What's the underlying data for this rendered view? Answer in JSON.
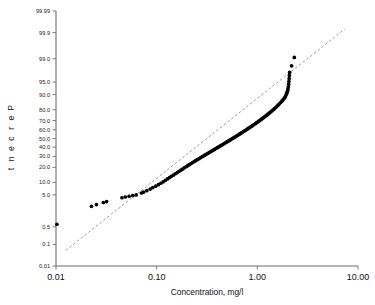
{
  "chart_data": {
    "type": "scatter",
    "title": "",
    "subtitle": "",
    "xlabel": "Concentration, mg/l",
    "ylabel": "Percent",
    "xscale": "log",
    "yscale": "probability",
    "xlim": [
      0.01,
      10.0
    ],
    "ylim": [
      0.01,
      99.99
    ],
    "grid": false,
    "legend": null,
    "x_ticks": [
      {
        "value": 0.01,
        "label": "0.01"
      },
      {
        "value": 0.1,
        "label": "0.10"
      },
      {
        "value": 1.0,
        "label": "1.00"
      },
      {
        "value": 10.0,
        "label": "10.00"
      }
    ],
    "y_ticks": [
      {
        "value": 99.99,
        "label": "99.99"
      },
      {
        "value": 99.9,
        "label": "99.9"
      },
      {
        "value": 99.0,
        "label": "99.0"
      },
      {
        "value": 95.0,
        "label": "95.0"
      },
      {
        "value": 90.0,
        "label": "90.0"
      },
      {
        "value": 80.0,
        "label": "80.0"
      },
      {
        "value": 70.0,
        "label": "70.0"
      },
      {
        "value": 60.0,
        "label": "60.0"
      },
      {
        "value": 50.0,
        "label": "50.0"
      },
      {
        "value": 40.0,
        "label": "40.0"
      },
      {
        "value": 30.0,
        "label": "30.0"
      },
      {
        "value": 20.0,
        "label": "20.0"
      },
      {
        "value": 10.0,
        "label": "10.0"
      },
      {
        "value": 5.0,
        "label": "5.0"
      },
      {
        "value": 0.5,
        "label": "0.5"
      },
      {
        "value": 0.1,
        "label": "0.1"
      },
      {
        "value": 0.01,
        "label": "0.01"
      }
    ],
    "reference_line": {
      "style": "dashed",
      "color": "#8a8a8a",
      "x_start": 0.0125,
      "y_start": 0.055,
      "x_end": 7.4,
      "y_end": 99.93
    },
    "series": [
      {
        "name": "Concentration observations",
        "marker": "filled-circle",
        "color": "#000000",
        "points": [
          {
            "x": 0.0102,
            "y": 0.62
          },
          {
            "x": 0.0225,
            "y": 2.4
          },
          {
            "x": 0.0252,
            "y": 2.7
          },
          {
            "x": 0.0295,
            "y": 3.1
          },
          {
            "x": 0.0318,
            "y": 3.3
          },
          {
            "x": 0.0452,
            "y": 4.2
          },
          {
            "x": 0.0488,
            "y": 4.4
          },
          {
            "x": 0.0532,
            "y": 4.6
          },
          {
            "x": 0.0578,
            "y": 4.8
          },
          {
            "x": 0.0625,
            "y": 5.0
          },
          {
            "x": 0.0705,
            "y": 5.6
          },
          {
            "x": 0.0742,
            "y": 5.9
          },
          {
            "x": 0.0798,
            "y": 6.4
          },
          {
            "x": 0.0862,
            "y": 7.0
          },
          {
            "x": 0.0915,
            "y": 7.6
          },
          {
            "x": 0.0978,
            "y": 8.2
          },
          {
            "x": 0.104,
            "y": 8.9
          },
          {
            "x": 0.11,
            "y": 9.6
          },
          {
            "x": 0.116,
            "y": 10.3
          },
          {
            "x": 0.122,
            "y": 11.1
          },
          {
            "x": 0.128,
            "y": 11.9
          },
          {
            "x": 0.134,
            "y": 12.7
          },
          {
            "x": 0.14,
            "y": 13.5
          },
          {
            "x": 0.147,
            "y": 14.3
          },
          {
            "x": 0.153,
            "y": 15.2
          },
          {
            "x": 0.16,
            "y": 16.0
          },
          {
            "x": 0.167,
            "y": 16.9
          },
          {
            "x": 0.174,
            "y": 17.8
          },
          {
            "x": 0.181,
            "y": 18.7
          },
          {
            "x": 0.188,
            "y": 19.6
          },
          {
            "x": 0.196,
            "y": 20.5
          },
          {
            "x": 0.203,
            "y": 21.4
          },
          {
            "x": 0.211,
            "y": 22.3
          },
          {
            "x": 0.219,
            "y": 23.2
          },
          {
            "x": 0.227,
            "y": 24.1
          },
          {
            "x": 0.236,
            "y": 25.0
          },
          {
            "x": 0.244,
            "y": 25.9
          },
          {
            "x": 0.253,
            "y": 26.8
          },
          {
            "x": 0.262,
            "y": 27.7
          },
          {
            "x": 0.271,
            "y": 28.6
          },
          {
            "x": 0.281,
            "y": 29.5
          },
          {
            "x": 0.29,
            "y": 30.4
          },
          {
            "x": 0.3,
            "y": 31.3
          },
          {
            "x": 0.31,
            "y": 32.2
          },
          {
            "x": 0.321,
            "y": 33.1
          },
          {
            "x": 0.331,
            "y": 34.0
          },
          {
            "x": 0.342,
            "y": 34.9
          },
          {
            "x": 0.353,
            "y": 35.8
          },
          {
            "x": 0.365,
            "y": 36.7
          },
          {
            "x": 0.376,
            "y": 37.6
          },
          {
            "x": 0.388,
            "y": 38.5
          },
          {
            "x": 0.4,
            "y": 39.4
          },
          {
            "x": 0.413,
            "y": 40.3
          },
          {
            "x": 0.425,
            "y": 41.2
          },
          {
            "x": 0.438,
            "y": 42.1
          },
          {
            "x": 0.452,
            "y": 43.0
          },
          {
            "x": 0.465,
            "y": 43.9
          },
          {
            "x": 0.479,
            "y": 44.8
          },
          {
            "x": 0.493,
            "y": 45.7
          },
          {
            "x": 0.508,
            "y": 46.6
          },
          {
            "x": 0.523,
            "y": 47.5
          },
          {
            "x": 0.538,
            "y": 48.4
          },
          {
            "x": 0.554,
            "y": 49.3
          },
          {
            "x": 0.57,
            "y": 50.2
          },
          {
            "x": 0.587,
            "y": 51.1
          },
          {
            "x": 0.604,
            "y": 52.0
          },
          {
            "x": 0.621,
            "y": 52.9
          },
          {
            "x": 0.639,
            "y": 53.8
          },
          {
            "x": 0.657,
            "y": 54.7
          },
          {
            "x": 0.676,
            "y": 55.6
          },
          {
            "x": 0.695,
            "y": 56.5
          },
          {
            "x": 0.715,
            "y": 57.4
          },
          {
            "x": 0.735,
            "y": 58.3
          },
          {
            "x": 0.756,
            "y": 59.2
          },
          {
            "x": 0.777,
            "y": 60.1
          },
          {
            "x": 0.799,
            "y": 61.0
          },
          {
            "x": 0.822,
            "y": 61.9
          },
          {
            "x": 0.845,
            "y": 62.8
          },
          {
            "x": 0.869,
            "y": 63.7
          },
          {
            "x": 0.893,
            "y": 64.6
          },
          {
            "x": 0.918,
            "y": 65.5
          },
          {
            "x": 0.944,
            "y": 66.4
          },
          {
            "x": 0.971,
            "y": 67.3
          },
          {
            "x": 0.998,
            "y": 68.2
          },
          {
            "x": 1.026,
            "y": 69.1
          },
          {
            "x": 1.055,
            "y": 70.0
          },
          {
            "x": 1.085,
            "y": 70.9
          },
          {
            "x": 1.116,
            "y": 71.8
          },
          {
            "x": 1.147,
            "y": 72.7
          },
          {
            "x": 1.18,
            "y": 73.6
          },
          {
            "x": 1.213,
            "y": 74.5
          },
          {
            "x": 1.248,
            "y": 75.4
          },
          {
            "x": 1.283,
            "y": 76.3
          },
          {
            "x": 1.32,
            "y": 77.2
          },
          {
            "x": 1.357,
            "y": 78.1
          },
          {
            "x": 1.396,
            "y": 79.0
          },
          {
            "x": 1.436,
            "y": 79.9
          },
          {
            "x": 1.477,
            "y": 80.8
          },
          {
            "x": 1.52,
            "y": 81.7
          },
          {
            "x": 1.563,
            "y": 82.6
          },
          {
            "x": 1.608,
            "y": 83.5
          },
          {
            "x": 1.655,
            "y": 84.4
          },
          {
            "x": 1.702,
            "y": 85.3
          },
          {
            "x": 1.752,
            "y": 86.2
          },
          {
            "x": 1.802,
            "y": 87.1
          },
          {
            "x": 1.855,
            "y": 88.0
          },
          {
            "x": 1.893,
            "y": 88.9
          },
          {
            "x": 1.93,
            "y": 89.8
          },
          {
            "x": 1.962,
            "y": 90.7
          },
          {
            "x": 1.99,
            "y": 91.6
          },
          {
            "x": 2.012,
            "y": 92.5
          },
          {
            "x": 2.03,
            "y": 93.4
          },
          {
            "x": 2.045,
            "y": 94.3
          },
          {
            "x": 2.058,
            "y": 95.2
          },
          {
            "x": 2.07,
            "y": 96.0
          },
          {
            "x": 2.082,
            "y": 96.7
          },
          {
            "x": 2.095,
            "y": 97.3
          },
          {
            "x": 2.19,
            "y": 98.3
          },
          {
            "x": 2.33,
            "y": 99.1
          }
        ]
      }
    ]
  }
}
